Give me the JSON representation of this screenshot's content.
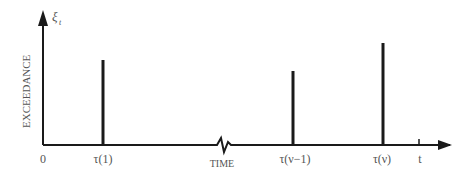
{
  "diagram": {
    "y_axis_symbol": "ξ",
    "y_axis_subscript": "t",
    "y_axis_label": "EXCEEDANCE",
    "x_axis_label": "TIME",
    "origin_label": "0",
    "t_label": "t",
    "events": [
      {
        "label": "τ(1)",
        "relative_height": 0.85
      },
      {
        "label": "τ(ν−1)",
        "relative_height": 0.73
      },
      {
        "label": "τ(ν)",
        "relative_height": 1.0
      }
    ],
    "axis_break": "zigzag break in time axis",
    "colors": {
      "ink": "#1a1a1a",
      "label": "#555555"
    }
  }
}
